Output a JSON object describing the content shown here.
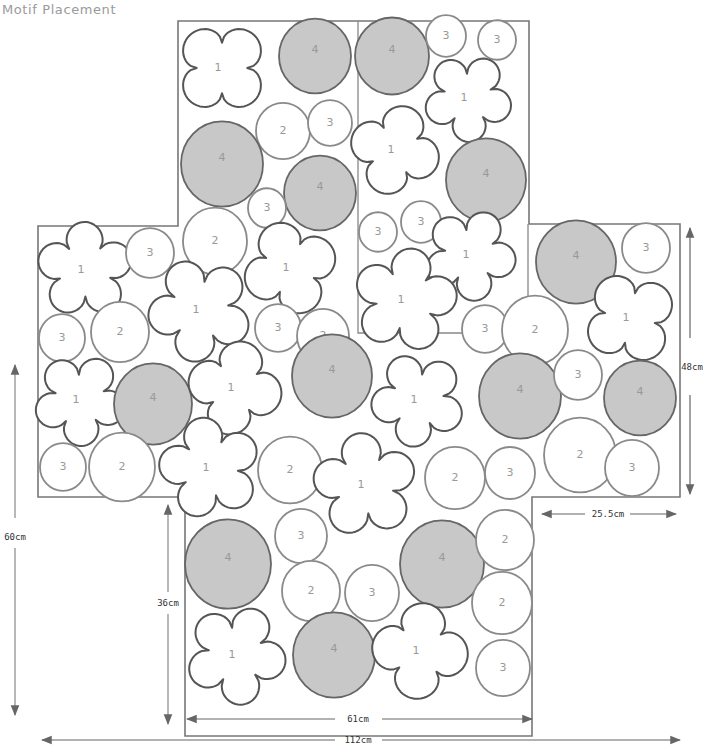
{
  "header": {
    "title": "Motif Placement"
  },
  "legend_motifs": {
    "1": "flower motif",
    "2": "large circle motif",
    "3": "small circle motif",
    "4": "shaded circle motif"
  },
  "colors": {
    "outline": "#777777",
    "motif_stroke": "#555555",
    "circle_stroke": "#8a8a8a",
    "shaded_fill": "#c8c8c8",
    "label": "#999999",
    "dimension": "#666666"
  },
  "dimensions": {
    "total_width": "112cm",
    "bottom_width": "61cm",
    "right_width": "25.5cm",
    "total_height": "60cm",
    "bottom_height": "36cm",
    "side_height": "48cm"
  },
  "motifs": [
    {
      "type": "flower",
      "label": "1",
      "x": 222,
      "y": 68,
      "r": 46
    },
    {
      "type": "shaded",
      "label": "4",
      "x": 315,
      "y": 56,
      "r": 36
    },
    {
      "type": "shaded",
      "label": "4",
      "x": 392,
      "y": 56,
      "r": 37
    },
    {
      "type": "circle",
      "label": "3",
      "x": 446,
      "y": 36,
      "r": 20
    },
    {
      "type": "circle",
      "label": "3",
      "x": 497,
      "y": 40,
      "r": 19
    },
    {
      "type": "flower",
      "label": "1",
      "x": 468,
      "y": 98,
      "r": 44
    },
    {
      "type": "circle",
      "label": "2",
      "x": 283,
      "y": 131,
      "r": 27
    },
    {
      "type": "circle",
      "label": "3",
      "x": 330,
      "y": 123,
      "r": 22
    },
    {
      "type": "shaded",
      "label": "4",
      "x": 222,
      "y": 164,
      "r": 41
    },
    {
      "type": "flower",
      "label": "1",
      "x": 395,
      "y": 150,
      "r": 45
    },
    {
      "type": "shaded",
      "label": "4",
      "x": 320,
      "y": 193,
      "r": 36
    },
    {
      "type": "shaded",
      "label": "4",
      "x": 486,
      "y": 180,
      "r": 40
    },
    {
      "type": "circle",
      "label": "3",
      "x": 267,
      "y": 208,
      "r": 19
    },
    {
      "type": "circle",
      "label": "2",
      "x": 215,
      "y": 241,
      "r": 32
    },
    {
      "type": "circle",
      "label": "3",
      "x": 378,
      "y": 232,
      "r": 19
    },
    {
      "type": "circle",
      "label": "3",
      "x": 421,
      "y": 222,
      "r": 20
    },
    {
      "type": "flower",
      "label": "1",
      "x": 470,
      "y": 255,
      "r": 46
    },
    {
      "type": "shaded",
      "label": "4",
      "x": 576,
      "y": 262,
      "r": 40
    },
    {
      "type": "circle",
      "label": "3",
      "x": 646,
      "y": 248,
      "r": 24
    },
    {
      "type": "flower",
      "label": "1",
      "x": 85,
      "y": 270,
      "r": 48
    },
    {
      "type": "circle",
      "label": "3",
      "x": 150,
      "y": 253,
      "r": 24
    },
    {
      "type": "flower",
      "label": "1",
      "x": 290,
      "y": 268,
      "r": 47
    },
    {
      "type": "flower",
      "label": "1",
      "x": 200,
      "y": 310,
      "r": 52
    },
    {
      "type": "flower",
      "label": "1",
      "x": 405,
      "y": 300,
      "r": 52
    },
    {
      "type": "circle",
      "label": "3",
      "x": 62,
      "y": 338,
      "r": 23
    },
    {
      "type": "circle",
      "label": "2",
      "x": 120,
      "y": 332,
      "r": 29
    },
    {
      "type": "circle",
      "label": "3",
      "x": 278,
      "y": 328,
      "r": 23
    },
    {
      "type": "circle",
      "label": "2",
      "x": 323,
      "y": 336,
      "r": 26
    },
    {
      "type": "circle",
      "label": "3",
      "x": 485,
      "y": 329,
      "r": 23
    },
    {
      "type": "circle",
      "label": "2",
      "x": 535,
      "y": 330,
      "r": 33
    },
    {
      "type": "flower",
      "label": "1",
      "x": 630,
      "y": 318,
      "r": 46
    },
    {
      "type": "flower",
      "label": "1",
      "x": 80,
      "y": 400,
      "r": 46
    },
    {
      "type": "shaded",
      "label": "4",
      "x": 153,
      "y": 404,
      "r": 39
    },
    {
      "type": "flower",
      "label": "1",
      "x": 235,
      "y": 388,
      "r": 47
    },
    {
      "type": "shaded",
      "label": "4",
      "x": 332,
      "y": 376,
      "r": 40
    },
    {
      "type": "flower",
      "label": "1",
      "x": 418,
      "y": 400,
      "r": 47
    },
    {
      "type": "shaded",
      "label": "4",
      "x": 520,
      "y": 396,
      "r": 41
    },
    {
      "type": "circle",
      "label": "3",
      "x": 578,
      "y": 375,
      "r": 24
    },
    {
      "type": "shaded",
      "label": "4",
      "x": 640,
      "y": 398,
      "r": 36
    },
    {
      "type": "circle",
      "label": "3",
      "x": 63,
      "y": 467,
      "r": 23
    },
    {
      "type": "circle",
      "label": "2",
      "x": 122,
      "y": 467,
      "r": 33
    },
    {
      "type": "flower",
      "label": "1",
      "x": 210,
      "y": 468,
      "r": 51
    },
    {
      "type": "circle",
      "label": "2",
      "x": 290,
      "y": 470,
      "r": 32
    },
    {
      "type": "flower",
      "label": "1",
      "x": 365,
      "y": 485,
      "r": 52
    },
    {
      "type": "circle",
      "label": "2",
      "x": 455,
      "y": 478,
      "r": 30
    },
    {
      "type": "circle",
      "label": "3",
      "x": 510,
      "y": 473,
      "r": 25
    },
    {
      "type": "circle",
      "label": "2",
      "x": 580,
      "y": 455,
      "r": 36
    },
    {
      "type": "circle",
      "label": "3",
      "x": 632,
      "y": 468,
      "r": 27
    },
    {
      "type": "shaded",
      "label": "4",
      "x": 228,
      "y": 564,
      "r": 43
    },
    {
      "type": "circle",
      "label": "3",
      "x": 301,
      "y": 536,
      "r": 26
    },
    {
      "type": "shaded",
      "label": "4",
      "x": 442,
      "y": 564,
      "r": 42
    },
    {
      "type": "circle",
      "label": "2",
      "x": 505,
      "y": 540,
      "r": 29
    },
    {
      "type": "circle",
      "label": "2",
      "x": 311,
      "y": 591,
      "r": 29
    },
    {
      "type": "circle",
      "label": "3",
      "x": 372,
      "y": 593,
      "r": 27
    },
    {
      "type": "circle",
      "label": "2",
      "x": 502,
      "y": 603,
      "r": 30
    },
    {
      "type": "flower",
      "label": "1",
      "x": 236,
      "y": 655,
      "r": 50
    },
    {
      "type": "shaded",
      "label": "4",
      "x": 334,
      "y": 655,
      "r": 41
    },
    {
      "type": "flower",
      "label": "1",
      "x": 420,
      "y": 651,
      "r": 48
    },
    {
      "type": "circle",
      "label": "3",
      "x": 503,
      "y": 668,
      "r": 27
    }
  ]
}
